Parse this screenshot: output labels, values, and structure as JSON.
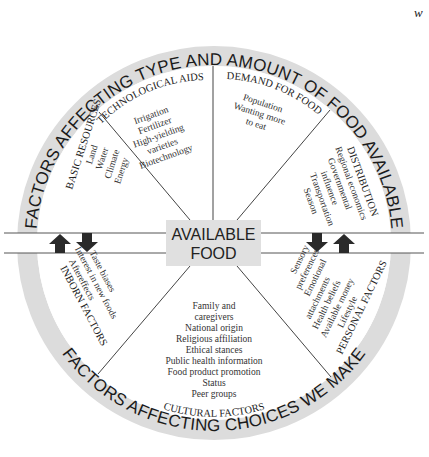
{
  "corner_mark": "w",
  "center": {
    "line1": "AVAILABLE",
    "line2": "FOOD"
  },
  "ring": {
    "top_label": "FACTORS AFFECTING TYPE AND AMOUNT OF FOOD AVAILABLE",
    "bottom_label": "FACTORS AFFECTING CHOICES WE MAKE"
  },
  "sections": {
    "basic_resources": {
      "title": "BASIC RESOURCES",
      "items": [
        "Land",
        "Water",
        "Climate",
        "Energy"
      ]
    },
    "technological_aids": {
      "title": "TECHNOLOGICAL AIDS",
      "items": [
        "Irrigation",
        "Fertilizer",
        "High-yielding",
        "varieties",
        "Biotechnology"
      ]
    },
    "demand_for_food": {
      "title": "DEMAND FOR FOOD",
      "items": [
        "Population",
        "Wanting more",
        "to eat"
      ]
    },
    "distribution": {
      "title": "DISTRIBUTION",
      "items": [
        "Regional economics",
        "Governmental",
        "influence",
        "Transportation",
        "Season"
      ]
    },
    "inborn_factors": {
      "title": "INBORN FACTORS",
      "items": [
        "Taste biases",
        "Interest in new foods",
        "Aftereffects"
      ]
    },
    "cultural_factors": {
      "title": "CULTURAL FACTORS",
      "items": [
        "Family and",
        "caregivers",
        "National origin",
        "Religious affiliation",
        "Ethical stances",
        "Public health information",
        "Food product promotion",
        "Status",
        "Peer groups"
      ]
    },
    "personal_factors": {
      "title": "PERSONAL FACTORS",
      "items": [
        "Sensory",
        "preferences",
        "Emotional",
        "attachments",
        "Health beliefs",
        "Available money",
        "Lifestyle"
      ]
    }
  },
  "arrows": {
    "left": [
      "up-arrow",
      "down-arrow"
    ],
    "right": [
      "down-arrow",
      "up-arrow"
    ]
  },
  "colors": {
    "ring": "#dcdcdc",
    "center_box": "#e0e0e0",
    "lines": "#444444",
    "arrows": "#2a2a2a"
  }
}
